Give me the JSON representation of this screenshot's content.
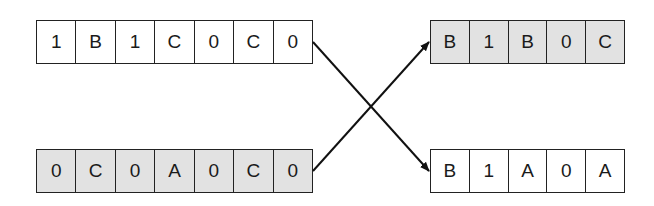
{
  "diagram": {
    "type": "crossover",
    "colors": {
      "gray_fill": "#e2e2e2",
      "white_fill": "#ffffff",
      "stroke": "#222222"
    },
    "parents": [
      {
        "id": "top-left",
        "fill": "white",
        "cells": [
          "1",
          "B",
          "1",
          "C",
          "0",
          "C",
          "0"
        ]
      },
      {
        "id": "bottom-left",
        "fill": "gray",
        "cells": [
          "0",
          "C",
          "0",
          "A",
          "0",
          "C",
          "0"
        ]
      }
    ],
    "children": [
      {
        "id": "top-right",
        "fill": "gray",
        "cells": [
          "B",
          "1",
          "B",
          "0",
          "C"
        ]
      },
      {
        "id": "bottom-right",
        "fill": "white",
        "cells": [
          "B",
          "1",
          "A",
          "0",
          "A"
        ]
      }
    ],
    "arrows": [
      {
        "from": "top-left",
        "to": "bottom-right"
      },
      {
        "from": "bottom-left",
        "to": "top-right"
      }
    ]
  }
}
